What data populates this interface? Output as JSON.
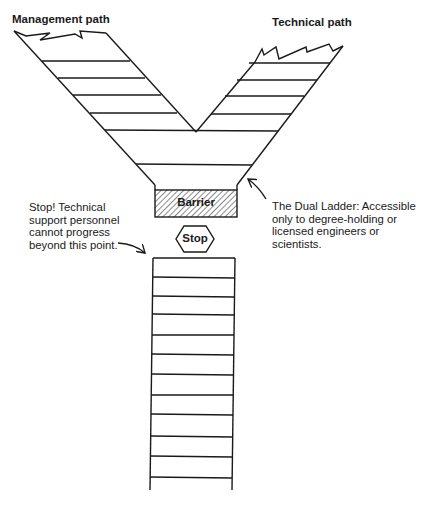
{
  "labels": {
    "management_path": "Management path",
    "technical_path": "Technical path",
    "barrier": "Barrier",
    "stop": "Stop"
  },
  "annotations": {
    "stop_note": "Stop! Technical\nsupport personnel\ncannot progress\nbeyond this point.",
    "dual_ladder_note": "The Dual Ladder: Accessible\nonly to degree-holding or\nlicensed engineers or\nscientists."
  },
  "colors": {
    "line": "#1a1a1a",
    "background": "#ffffff"
  }
}
